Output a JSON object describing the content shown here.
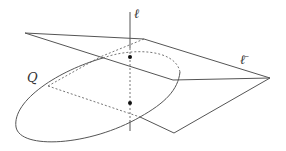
{
  "diagram": {
    "labels": {
      "line": "ℓ",
      "line_bar": "ℓ̄",
      "quadric": "Q"
    },
    "colors": {
      "stroke": "#555555",
      "dashed": "#666666",
      "point": "#111111",
      "label": "#333333"
    },
    "points": [
      {
        "name": "upper-intersection",
        "x": 130,
        "y": 57
      },
      {
        "name": "lower-intersection",
        "x": 130,
        "y": 103
      }
    ]
  }
}
